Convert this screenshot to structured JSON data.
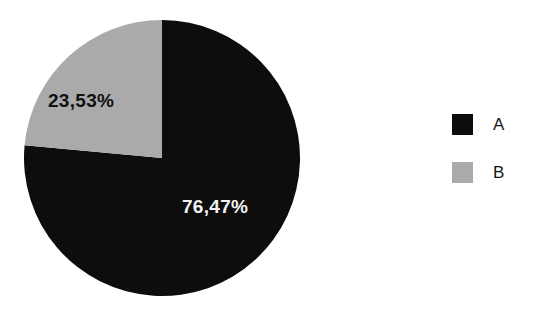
{
  "chart_data": {
    "type": "pie",
    "title": "",
    "title_note": "top title line is cropped off above the image edge and unreadable",
    "categories": [
      "A",
      "B"
    ],
    "values": [
      76.47,
      23.53
    ],
    "value_unit": "%",
    "data_labels": [
      "76,47%",
      "23,53%"
    ],
    "colors": [
      "#0d0d0d",
      "#aaaaaa"
    ],
    "legend_position": "right",
    "grid": false,
    "start_angle_deg": 90,
    "direction": "counterclockwise",
    "series": [
      {
        "name": "A",
        "value": 76.47,
        "label": "76,47%",
        "color": "#0d0d0d"
      },
      {
        "name": "B",
        "value": 23.53,
        "label": "23,53%",
        "color": "#aaaaaa"
      }
    ]
  },
  "pie": {
    "label_a": "76,47%",
    "label_b": "23,53%"
  },
  "legend": {
    "items": [
      {
        "label": "A",
        "color": "#0d0d0d"
      },
      {
        "label": "B",
        "color": "#aaaaaa"
      }
    ]
  },
  "colors": {
    "background": "#ffffff",
    "slice_a": "#0d0d0d",
    "slice_b": "#aaaaaa",
    "label_on_dark": "#f2f2f2",
    "label_on_light": "#111111"
  }
}
